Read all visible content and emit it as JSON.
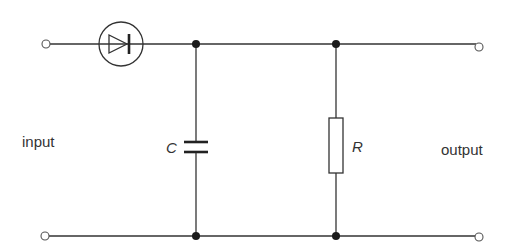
{
  "diagram": {
    "labels": {
      "input": "input",
      "output": "output",
      "capacitor": "C",
      "resistor": "R"
    },
    "components": [
      {
        "id": "D",
        "type": "diode",
        "enclosed_in_circle": true,
        "direction": "left-to-right"
      },
      {
        "id": "C",
        "type": "capacitor",
        "connection": "shunt"
      },
      {
        "id": "R",
        "type": "resistor",
        "connection": "shunt"
      }
    ],
    "colors": {
      "line": "#333333",
      "background": "#ffffff"
    }
  }
}
